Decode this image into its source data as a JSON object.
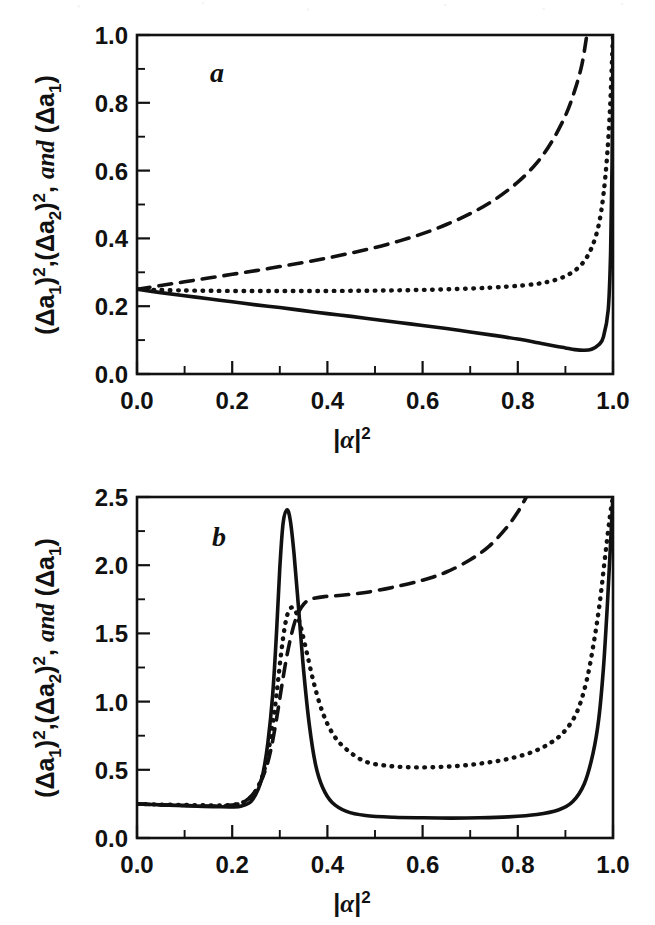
{
  "figure": {
    "background": "#ffffff",
    "ink_color": "#111111",
    "panels": [
      "a",
      "b"
    ]
  },
  "panel_a": {
    "letter": "a",
    "x_axis_title": "|α|²",
    "y_axis_title": "(Δa₁)²,(Δa₂)², and (Δa₁)",
    "x_ticks": [
      "0.0",
      "0.2",
      "0.4",
      "0.6",
      "0.8",
      "1.0"
    ],
    "y_ticks": [
      "0.0",
      "0.2",
      "0.4",
      "0.6",
      "0.8",
      "1.0"
    ]
  },
  "panel_b": {
    "letter": "b",
    "x_axis_title": "|α|²",
    "y_axis_title": "(Δa₁)²,(Δa₂)², and (Δa₁)",
    "x_ticks": [
      "0.0",
      "0.2",
      "0.4",
      "0.6",
      "0.8",
      "1.0"
    ],
    "y_ticks": [
      "0.0",
      "0.5",
      "1.0",
      "1.5",
      "2.0",
      "2.5"
    ]
  },
  "chart_data": [
    {
      "type": "line",
      "id": "panel-a",
      "title": "a",
      "xlabel": "|α|²",
      "ylabel": "(Δa₁)²,(Δa₂)², and (Δa₁)",
      "xlim": [
        0.0,
        1.0
      ],
      "ylim": [
        0.0,
        1.0
      ],
      "xticks": [
        0.0,
        0.2,
        0.4,
        0.6,
        0.8,
        1.0
      ],
      "yticks": [
        0.0,
        0.2,
        0.4,
        0.6,
        0.8,
        1.0
      ],
      "xminor_step": 0.1,
      "yminor_step": 0.1,
      "grid": false,
      "legend": "none",
      "series": [
        {
          "name": "(Δa₁)²",
          "style": "solid",
          "x": [
            0.0,
            0.05,
            0.1,
            0.15,
            0.2,
            0.25,
            0.3,
            0.35,
            0.4,
            0.45,
            0.5,
            0.55,
            0.6,
            0.65,
            0.7,
            0.75,
            0.8,
            0.85,
            0.88,
            0.9,
            0.92,
            0.94,
            0.955,
            0.97,
            0.98,
            0.99,
            0.995,
            0.998,
            1.0
          ],
          "y": [
            0.25,
            0.24,
            0.231,
            0.222,
            0.213,
            0.204,
            0.196,
            0.187,
            0.178,
            0.17,
            0.161,
            0.152,
            0.143,
            0.134,
            0.124,
            0.114,
            0.103,
            0.09,
            0.082,
            0.077,
            0.072,
            0.07,
            0.073,
            0.086,
            0.11,
            0.19,
            0.36,
            0.62,
            1.0
          ]
        },
        {
          "name": "(Δa₂)²",
          "style": "dotted",
          "x": [
            0.0,
            0.04,
            0.08,
            0.12,
            0.2,
            0.3,
            0.4,
            0.5,
            0.6,
            0.7,
            0.78,
            0.84,
            0.88,
            0.91,
            0.935,
            0.955,
            0.97,
            0.98,
            0.988,
            0.994,
            0.998,
            1.0
          ],
          "y": [
            0.25,
            0.248,
            0.247,
            0.246,
            0.245,
            0.245,
            0.245,
            0.246,
            0.248,
            0.252,
            0.258,
            0.266,
            0.278,
            0.296,
            0.325,
            0.372,
            0.44,
            0.53,
            0.65,
            0.79,
            0.93,
            1.0
          ]
        },
        {
          "name": "(Δa₁)",
          "style": "dashed",
          "x": [
            0.0,
            0.05,
            0.1,
            0.15,
            0.2,
            0.25,
            0.3,
            0.35,
            0.4,
            0.45,
            0.5,
            0.55,
            0.6,
            0.65,
            0.7,
            0.75,
            0.8,
            0.84,
            0.87,
            0.9,
            0.92,
            0.935,
            0.945
          ],
          "y": [
            0.25,
            0.261,
            0.272,
            0.283,
            0.294,
            0.305,
            0.317,
            0.329,
            0.342,
            0.357,
            0.373,
            0.392,
            0.414,
            0.441,
            0.473,
            0.513,
            0.566,
            0.623,
            0.682,
            0.762,
            0.838,
            0.915,
            1.0
          ]
        }
      ]
    },
    {
      "type": "line",
      "id": "panel-b",
      "title": "b",
      "xlabel": "|α|²",
      "ylabel": "(Δa₁)²,(Δa₂)², and (Δa₁)",
      "xlim": [
        0.0,
        1.0
      ],
      "ylim": [
        0.0,
        2.5
      ],
      "xticks": [
        0.0,
        0.2,
        0.4,
        0.6,
        0.8,
        1.0
      ],
      "yticks": [
        0.0,
        0.5,
        1.0,
        1.5,
        2.0,
        2.5
      ],
      "xminor_step": 0.1,
      "yminor_step": 0.25,
      "grid": false,
      "legend": "none",
      "series": [
        {
          "name": "(Δa₁)²",
          "style": "solid",
          "x": [
            0.0,
            0.05,
            0.1,
            0.14,
            0.17,
            0.2,
            0.22,
            0.24,
            0.255,
            0.265,
            0.275,
            0.285,
            0.293,
            0.3,
            0.307,
            0.315,
            0.322,
            0.33,
            0.34,
            0.35,
            0.362,
            0.375,
            0.39,
            0.41,
            0.44,
            0.48,
            0.54,
            0.6,
            0.66,
            0.72,
            0.78,
            0.84,
            0.885,
            0.915,
            0.94,
            0.958,
            0.97,
            0.98,
            0.988,
            0.994,
            0.998,
            1.0
          ],
          "y": [
            0.25,
            0.243,
            0.237,
            0.232,
            0.229,
            0.228,
            0.235,
            0.27,
            0.36,
            0.48,
            0.7,
            1.05,
            1.5,
            1.98,
            2.31,
            2.405,
            2.33,
            2.08,
            1.66,
            1.23,
            0.83,
            0.54,
            0.37,
            0.26,
            0.195,
            0.165,
            0.152,
            0.148,
            0.146,
            0.148,
            0.155,
            0.172,
            0.205,
            0.265,
            0.4,
            0.62,
            0.87,
            1.25,
            1.7,
            2.1,
            2.38,
            2.5
          ]
        },
        {
          "name": "(Δa₂)²",
          "style": "dotted",
          "x": [
            0.0,
            0.05,
            0.1,
            0.14,
            0.18,
            0.21,
            0.235,
            0.252,
            0.265,
            0.275,
            0.285,
            0.294,
            0.302,
            0.31,
            0.318,
            0.327,
            0.336,
            0.346,
            0.358,
            0.372,
            0.39,
            0.412,
            0.44,
            0.48,
            0.53,
            0.58,
            0.63,
            0.68,
            0.73,
            0.78,
            0.83,
            0.87,
            0.9,
            0.925,
            0.945,
            0.96,
            0.972,
            0.982,
            0.99,
            0.996,
            1.0
          ],
          "y": [
            0.25,
            0.245,
            0.242,
            0.24,
            0.24,
            0.248,
            0.285,
            0.36,
            0.47,
            0.62,
            0.83,
            1.08,
            1.33,
            1.54,
            1.66,
            1.69,
            1.64,
            1.52,
            1.34,
            1.13,
            0.92,
            0.76,
            0.65,
            0.56,
            0.528,
            0.518,
            0.52,
            0.53,
            0.55,
            0.58,
            0.63,
            0.7,
            0.79,
            0.93,
            1.16,
            1.44,
            1.72,
            2.02,
            2.26,
            2.42,
            2.5
          ]
        },
        {
          "name": "(Δa₁)",
          "style": "dashed",
          "x": [
            0.0,
            0.05,
            0.1,
            0.14,
            0.18,
            0.21,
            0.235,
            0.255,
            0.27,
            0.282,
            0.293,
            0.303,
            0.313,
            0.323,
            0.333,
            0.345,
            0.358,
            0.375,
            0.395,
            0.43,
            0.48,
            0.54,
            0.6,
            0.65,
            0.7,
            0.74,
            0.775,
            0.8,
            0.818
          ],
          "y": [
            0.25,
            0.243,
            0.238,
            0.235,
            0.236,
            0.247,
            0.29,
            0.38,
            0.5,
            0.66,
            0.87,
            1.09,
            1.3,
            1.47,
            1.6,
            1.69,
            1.74,
            1.76,
            1.77,
            1.78,
            1.8,
            1.84,
            1.89,
            1.95,
            2.04,
            2.14,
            2.27,
            2.39,
            2.5
          ]
        }
      ]
    }
  ]
}
